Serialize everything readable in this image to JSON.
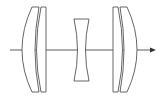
{
  "diagram": {
    "type": "optical-lens-layout",
    "colors": {
      "background": "#ffffff",
      "lens_stroke": "#555555",
      "axis": "#333333"
    },
    "optical_axis": {
      "y": 50,
      "x_start": 10,
      "x_end": 156,
      "direction": "right"
    },
    "groups": [
      {
        "name": "front-group",
        "elements": [
          "meniscus-1",
          "meniscus-2"
        ]
      },
      {
        "name": "center-element",
        "elements": [
          "biconcave"
        ]
      },
      {
        "name": "rear-group",
        "elements": [
          "meniscus-3",
          "meniscus-4"
        ]
      }
    ]
  }
}
